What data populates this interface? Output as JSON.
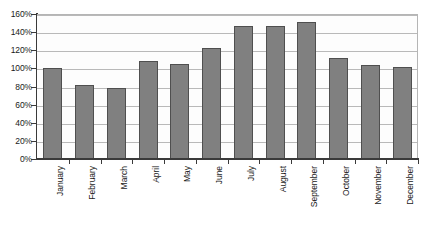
{
  "chart_data": {
    "type": "bar",
    "title": "",
    "xlabel": "",
    "ylabel": "",
    "categories": [
      "January",
      "February",
      "March",
      "April",
      "May",
      "June",
      "July",
      "August",
      "September",
      "October",
      "November",
      "December"
    ],
    "values": [
      100,
      82,
      78,
      108,
      105,
      123,
      147,
      147,
      151,
      112,
      104,
      101
    ],
    "ylim": [
      0,
      160
    ],
    "ytick_labels": [
      "160%",
      "140%",
      "120%",
      "100%",
      "80%",
      "60%",
      "40%",
      "20%",
      "0%"
    ],
    "ytick_values": [
      160,
      140,
      120,
      100,
      80,
      60,
      40,
      20,
      0
    ],
    "ytick_step": 20,
    "grid": true,
    "legend": null,
    "colors": {
      "bar_fill": "#808080",
      "bar_border": "#4f4f4f",
      "gridline": "#b9b9b9",
      "axis": "#3a3a3a",
      "plot_background": "#fdfdfd",
      "page_background": "#ffffff",
      "text": "#1a1a1a"
    }
  }
}
